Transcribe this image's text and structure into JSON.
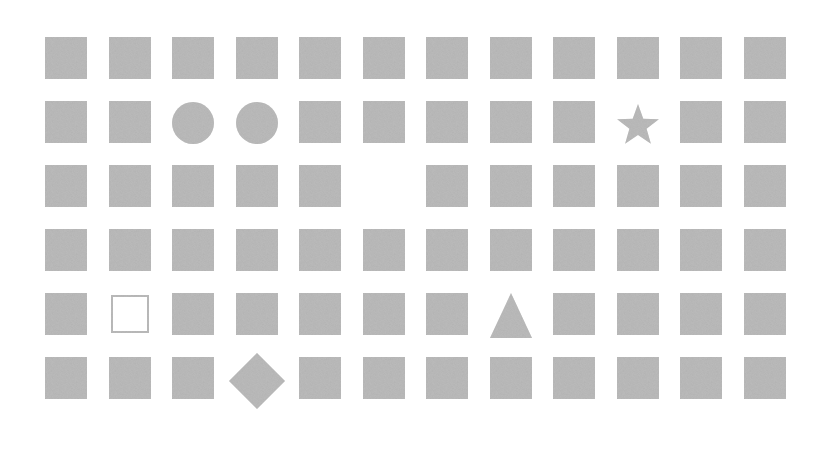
{
  "grid": {
    "rows": 6,
    "cols": 12,
    "origin_x": 45,
    "origin_y": 37,
    "pitch_x": 63.5,
    "pitch_y": 64,
    "tile_size": 42,
    "fill_color": "#b2b2b2",
    "background_color": "#ffffff",
    "default_shape": "square",
    "cells": [
      [
        "square",
        "square",
        "square",
        "square",
        "square",
        "square",
        "square",
        "square",
        "square",
        "square",
        "square",
        "square"
      ],
      [
        "square",
        "square",
        "circle",
        "circle",
        "square",
        "square",
        "square",
        "square",
        "square",
        "star",
        "square",
        "square"
      ],
      [
        "square",
        "square",
        "square",
        "square",
        "square",
        "empty",
        "square",
        "square",
        "square",
        "square",
        "square",
        "square"
      ],
      [
        "square",
        "square",
        "square",
        "square",
        "square",
        "square",
        "square",
        "square",
        "square",
        "square",
        "square",
        "square"
      ],
      [
        "square",
        "hollow-square",
        "square",
        "square",
        "square",
        "square",
        "square",
        "triangle",
        "square",
        "square",
        "square",
        "square"
      ],
      [
        "square",
        "square",
        "square",
        "diamond",
        "square",
        "square",
        "square",
        "square",
        "square",
        "square",
        "square",
        "square"
      ]
    ]
  }
}
